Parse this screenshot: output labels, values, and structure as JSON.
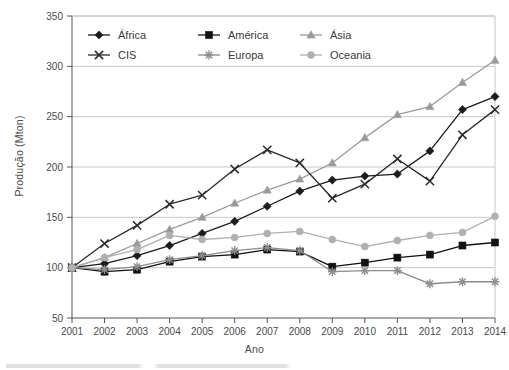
{
  "chart_data": {
    "type": "line",
    "title": "",
    "xlabel": "Ano",
    "ylabel": "Produção (Mton)",
    "categories": [
      "2001",
      "2002",
      "2003",
      "2004",
      "2005",
      "2006",
      "2007",
      "2008",
      "2009",
      "2010",
      "2011",
      "2012",
      "2013",
      "2014"
    ],
    "x": [
      2001,
      2002,
      2003,
      2004,
      2005,
      2006,
      2007,
      2008,
      2009,
      2010,
      2011,
      2012,
      2013,
      2014
    ],
    "xlim": [
      2001,
      2014
    ],
    "ylim": [
      50,
      350
    ],
    "ytick_labels": [
      "50",
      "100",
      "150",
      "200",
      "250",
      "300",
      "350"
    ],
    "yticks": [
      50,
      100,
      150,
      200,
      250,
      300,
      350
    ],
    "grid": "horizontal",
    "legend_position": "top-center-inside",
    "series": [
      {
        "name": "África",
        "marker": "diamond",
        "color": "#1c1c1c",
        "values": [
          100,
          104,
          112,
          122,
          134,
          146,
          161,
          176,
          187,
          191,
          193,
          216,
          257,
          270
        ]
      },
      {
        "name": "América",
        "marker": "square",
        "color": "#111111",
        "values": [
          100,
          96,
          98,
          106,
          111,
          113,
          118,
          116,
          101,
          105,
          110,
          113,
          122,
          125
        ]
      },
      {
        "name": "Ásia",
        "marker": "triangle",
        "color": "#9a9a9a",
        "values": [
          100,
          110,
          124,
          138,
          150,
          164,
          177,
          188,
          204,
          229,
          252,
          260,
          284,
          306
        ]
      },
      {
        "name": "CIS",
        "marker": "x",
        "color": "#2a2a2a",
        "values": [
          100,
          124,
          142,
          163,
          172,
          198,
          217,
          204,
          169,
          183,
          208,
          186,
          232,
          257
        ]
      },
      {
        "name": "Europa",
        "marker": "asterisk",
        "color": "#8c8c8c",
        "values": [
          100,
          98,
          101,
          108,
          112,
          117,
          120,
          117,
          96,
          97,
          97,
          84,
          86,
          86
        ]
      },
      {
        "name": "Oceania",
        "marker": "circle",
        "color": "#b0b0b0",
        "values": [
          100,
          110,
          118,
          132,
          128,
          130,
          134,
          136,
          128,
          121,
          127,
          132,
          135,
          151
        ]
      }
    ]
  },
  "legend": {
    "entries": [
      {
        "label": "África",
        "marker": "diamond",
        "color": "#1c1c1c"
      },
      {
        "label": "América",
        "marker": "square",
        "color": "#111111"
      },
      {
        "label": "Ásia",
        "marker": "triangle",
        "color": "#9a9a9a"
      },
      {
        "label": "CIS",
        "marker": "x",
        "color": "#2a2a2a"
      },
      {
        "label": "Europa",
        "marker": "asterisk",
        "color": "#8c8c8c"
      },
      {
        "label": "Oceania",
        "marker": "circle",
        "color": "#b0b0b0"
      }
    ]
  },
  "axes": {
    "y_title": "Produção (Mton)",
    "x_title": "Ano"
  },
  "style": {
    "axis_color": "#555555",
    "grid_color": "#c8c8c8",
    "text_color": "#4a4a4a"
  }
}
